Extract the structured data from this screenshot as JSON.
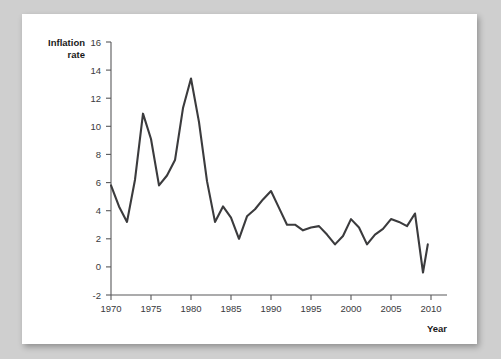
{
  "chart_data": {
    "type": "line",
    "title": "",
    "xlabel": "Year",
    "ylabel": "Inflation rate",
    "ylabel_line1": "Inflation",
    "ylabel_line2": "rate",
    "xlim": [
      1969,
      2011
    ],
    "ylim": [
      -2,
      16
    ],
    "grid": false,
    "legend": "none",
    "yticks": [
      -2,
      0,
      2,
      4,
      6,
      8,
      10,
      12,
      14,
      16
    ],
    "ytick_labels": [
      "-2",
      "0",
      "2",
      "4",
      "6",
      "8",
      "10",
      "12",
      "14",
      "16"
    ],
    "xticks": [
      1970,
      1975,
      1980,
      1985,
      1990,
      1995,
      2000,
      2005,
      2010
    ],
    "xtick_labels": [
      "1970",
      "1975",
      "1980",
      "1985",
      "1990",
      "1995",
      "2000",
      "2005",
      "2010"
    ],
    "line_color": "#3b3b3d",
    "series": [
      {
        "name": "Inflation rate",
        "x": [
          1970,
          1971,
          1972,
          1973,
          1974,
          1975,
          1976,
          1977,
          1978,
          1979,
          1980,
          1981,
          1982,
          1983,
          1984,
          1985,
          1986,
          1987,
          1988,
          1989,
          1990,
          1991,
          1992,
          1993,
          1994,
          1995,
          1996,
          1997,
          1998,
          1999,
          2000,
          2001,
          2002,
          2003,
          2004,
          2005,
          2006,
          2007,
          2008,
          2009
        ],
        "values": [
          5.8,
          4.3,
          3.2,
          6.2,
          10.9,
          9.1,
          5.8,
          6.5,
          7.6,
          11.3,
          13.4,
          10.3,
          6.1,
          3.2,
          4.3,
          3.5,
          2.0,
          3.6,
          4.1,
          4.8,
          5.4,
          4.2,
          3.0,
          3.0,
          2.6,
          2.8,
          2.9,
          2.3,
          1.6,
          2.2,
          3.4,
          2.8,
          1.6,
          2.3,
          2.7,
          3.4,
          3.2,
          2.9,
          3.8,
          -0.4
        ]
      }
    ],
    "final_point": {
      "x": 2009.6,
      "value": 1.6
    }
  }
}
